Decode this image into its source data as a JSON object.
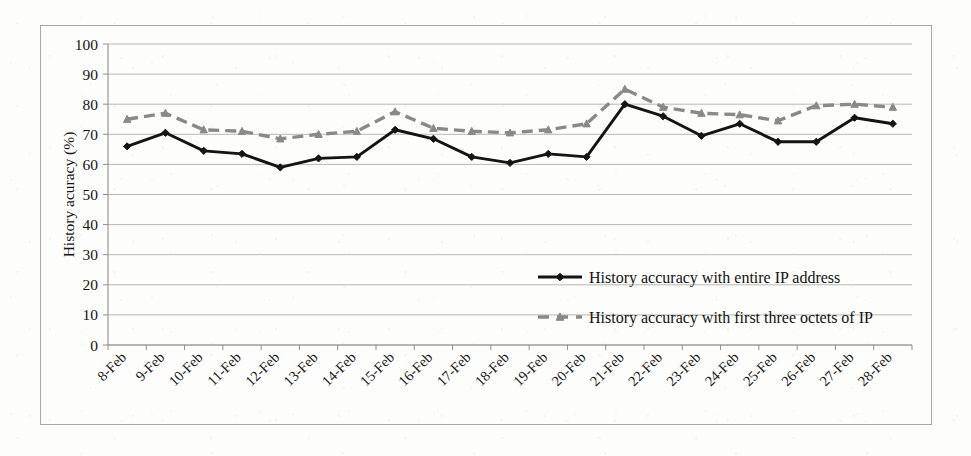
{
  "figure": {
    "background_color": "#fdfdfc",
    "frame_color": "#a9a9a4",
    "gridline_color": "#b8b8b3",
    "axis_color": "#8f8f8a"
  },
  "chart_data": {
    "type": "line",
    "title": "",
    "xlabel": "",
    "ylabel": "History acuracy (%)",
    "ylim": [
      0,
      100
    ],
    "ytick_step": 10,
    "ytick_labels": [
      "0",
      "10",
      "20",
      "30",
      "40",
      "50",
      "60",
      "70",
      "80",
      "90",
      "100"
    ],
    "grid": true,
    "legend_position": "inside-center-right",
    "categories": [
      "8-Feb",
      "9-Feb",
      "10-Feb",
      "11-Feb",
      "12-Feb",
      "13-Feb",
      "14-Feb",
      "15-Feb",
      "16-Feb",
      "17-Feb",
      "18-Feb",
      "19-Feb",
      "20-Feb",
      "21-Feb",
      "22-Feb",
      "23-Feb",
      "24-Feb",
      "25-Feb",
      "26-Feb",
      "27-Feb",
      "28-Feb"
    ],
    "series": [
      {
        "name": "History accuracy with entire IP address",
        "color": "#141414",
        "linestyle": "solid",
        "marker": "diamond",
        "values": [
          66,
          70.5,
          64.5,
          63.5,
          59,
          62,
          62.5,
          71.5,
          68.5,
          62.5,
          60.5,
          63.5,
          62.5,
          80,
          76,
          69.5,
          73.5,
          67.5,
          67.5,
          75.5,
          73.5
        ]
      },
      {
        "name": "History accuracy with first three octets of IP",
        "color": "#8a8a85",
        "linestyle": "dashed",
        "marker": "triangle",
        "values": [
          75,
          77,
          71.5,
          71,
          68.5,
          70,
          71,
          77.5,
          72,
          71,
          70.5,
          71.5,
          73.5,
          85,
          79,
          77,
          76.5,
          74.5,
          79.5,
          80,
          79
        ]
      }
    ]
  },
  "legend": {
    "entries": [
      {
        "label": "History accuracy with entire IP address",
        "marker": "diamond",
        "linestyle": "solid",
        "color": "#141414"
      },
      {
        "label": "History accuracy with first three octets of IP",
        "marker": "triangle",
        "linestyle": "dashed",
        "color": "#8a8a85"
      }
    ]
  }
}
